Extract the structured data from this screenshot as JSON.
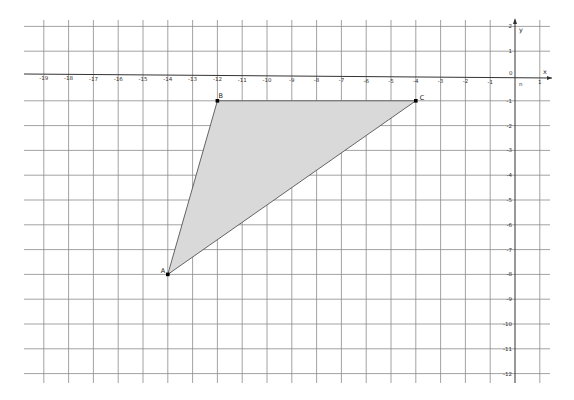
{
  "diagram": {
    "type": "coordinate-plane-triangle",
    "axes": {
      "x_label": "x",
      "y_label": "y",
      "origin_label": "0",
      "origin_sub_label": "n",
      "x_ticks": [
        "-19",
        "-18",
        "-17",
        "-16",
        "-15",
        "-14",
        "-13",
        "-12",
        "-11",
        "-10",
        "-9",
        "-8",
        "-7",
        "-6",
        "-5",
        "-4",
        "-3",
        "-2",
        "-1",
        "1"
      ],
      "y_ticks": [
        "2",
        "1",
        "-1",
        "-2",
        "-3",
        "-4",
        "-5",
        "-6",
        "-7",
        "-8",
        "-9",
        "-10",
        "-11",
        "-12"
      ],
      "x_range": [
        -19,
        1
      ],
      "y_range": [
        -12,
        2
      ]
    },
    "points": [
      {
        "label": "A",
        "x": -14,
        "y": -8
      },
      {
        "label": "B",
        "x": -12,
        "y": -1
      },
      {
        "label": "C",
        "x": -4,
        "y": -1
      }
    ],
    "polygon": {
      "vertices": [
        "A",
        "B",
        "C"
      ],
      "fill": "#d9d9d9",
      "stroke": "#555555"
    },
    "colors": {
      "grid": "#8a8a8a",
      "axis": "#333333",
      "point": "#000000"
    }
  }
}
